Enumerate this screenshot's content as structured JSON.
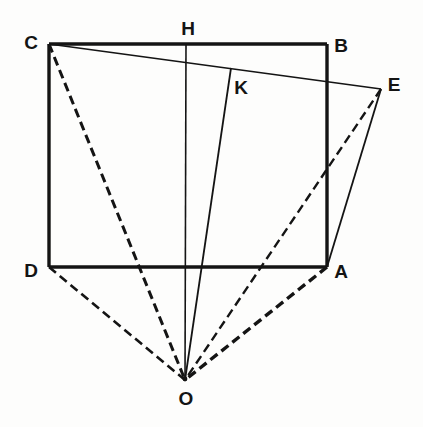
{
  "figure": {
    "background_color": "#fdfdfc",
    "ink_color": "#141414",
    "width": 423,
    "height": 427,
    "points": [
      {
        "name": "C",
        "label": "C",
        "x": 49,
        "y": 44,
        "label_x": 31,
        "label_y": 42
      },
      {
        "name": "H",
        "label": "H",
        "x": 186,
        "y": 44,
        "label_x": 188,
        "label_y": 28
      },
      {
        "name": "B",
        "label": "B",
        "x": 327,
        "y": 44,
        "label_x": 341,
        "label_y": 45
      },
      {
        "name": "E",
        "label": "E",
        "x": 381,
        "y": 89,
        "label_x": 394,
        "label_y": 84
      },
      {
        "name": "K",
        "label": "K",
        "x": 231,
        "y": 68,
        "label_x": 241,
        "label_y": 87
      },
      {
        "name": "D",
        "label": "D",
        "x": 49,
        "y": 267,
        "label_x": 31,
        "label_y": 270
      },
      {
        "name": "A",
        "label": "A",
        "x": 327,
        "y": 267,
        "label_x": 341,
        "label_y": 271
      },
      {
        "name": "O",
        "label": "O",
        "x": 185,
        "y": 380,
        "label_x": 186,
        "label_y": 398
      }
    ],
    "segments": [
      {
        "name": "rectangle-top-CB",
        "from": "C",
        "to": "B",
        "style": "solid",
        "weight": 3.4
      },
      {
        "name": "rectangle-left-CD",
        "from": "C",
        "to": "D",
        "style": "solid",
        "weight": 3.4
      },
      {
        "name": "rectangle-bottom-DA",
        "from": "D",
        "to": "A",
        "style": "solid",
        "weight": 3.4
      },
      {
        "name": "rectangle-right-BA",
        "from": "B",
        "to": "A",
        "style": "solid",
        "weight": 3.4
      },
      {
        "name": "line-C-to-E",
        "from": "C",
        "to": "E",
        "style": "solid",
        "weight": 1.6
      },
      {
        "name": "line-A-to-E",
        "from": "A",
        "to": "E",
        "style": "solid",
        "weight": 1.8
      },
      {
        "name": "line-H-to-O",
        "from": "H",
        "to": "O",
        "style": "solid",
        "weight": 1.6
      },
      {
        "name": "line-K-to-O",
        "from": "K",
        "to": "O",
        "style": "solid",
        "weight": 1.8
      },
      {
        "name": "dashed-C-to-O",
        "from": "C",
        "to": "O",
        "style": "dashed",
        "weight": 3.0
      },
      {
        "name": "dashed-D-to-O",
        "from": "D",
        "to": "O",
        "style": "dashed",
        "weight": 2.6
      },
      {
        "name": "dashed-E-to-O",
        "from": "E",
        "to": "O",
        "style": "dashed",
        "weight": 2.4
      },
      {
        "name": "dashed-A-to-O",
        "from": "A",
        "to": "O",
        "style": "dashed",
        "weight": 3.4
      }
    ],
    "dash_patterns": {
      "dashed": "9 5"
    }
  }
}
